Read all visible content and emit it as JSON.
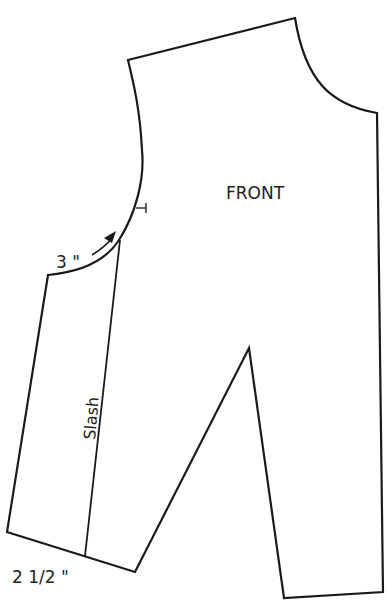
{
  "diagram": {
    "type": "sewing-pattern",
    "piece_label": "FRONT",
    "slash_label": "Slash",
    "armhole_measure_label": "3 \"",
    "hem_measure_label": "2 1/2 \"",
    "line_color": "#1a1a1a",
    "background": "#ffffff"
  }
}
